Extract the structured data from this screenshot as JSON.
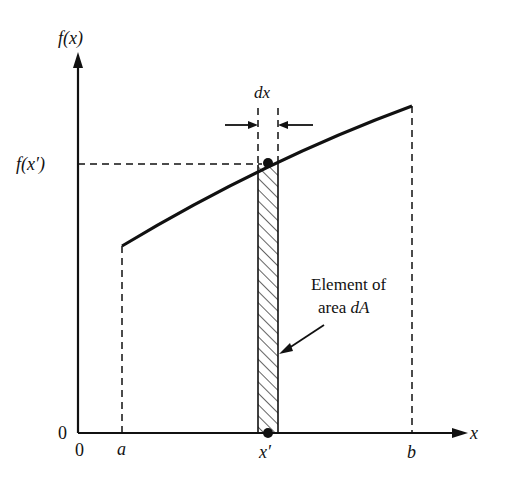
{
  "diagram": {
    "y_axis_label": "f(x)",
    "x_axis_label": "x",
    "origin_x_label": "0",
    "origin_y_label": "0",
    "fx_prime_label": "f(x′)",
    "a_label": "a",
    "b_label": "b",
    "x_prime_label": "x′",
    "dx_label": "dx",
    "annotation_line1": "Element of",
    "annotation_line2_prefix": "area ",
    "annotation_line2_var": "dA"
  },
  "colors": {
    "ink": "#111111",
    "background": "#ffffff"
  }
}
